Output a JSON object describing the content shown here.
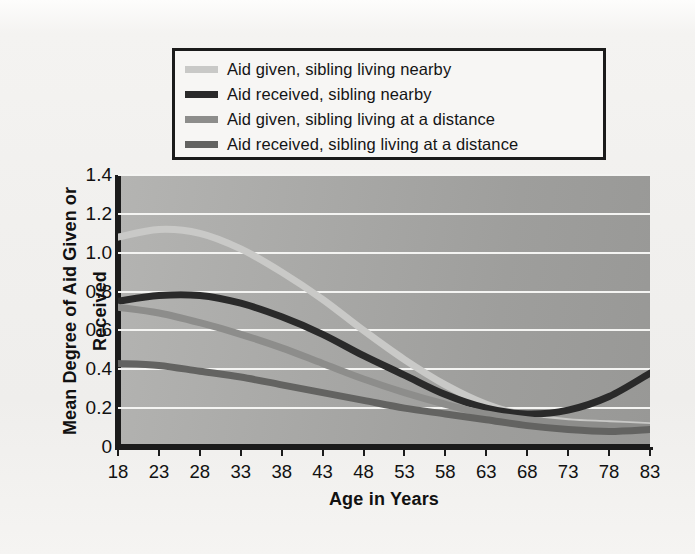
{
  "chart_data": {
    "type": "line",
    "title": "",
    "xlabel": "Age in Years",
    "ylabel": "Mean Degree of Aid Given or Received",
    "xlim": [
      18,
      83
    ],
    "ylim": [
      0,
      1.4
    ],
    "xticks": [
      18,
      23,
      28,
      33,
      38,
      43,
      48,
      53,
      58,
      63,
      68,
      73,
      78,
      83
    ],
    "yticks": [
      "0",
      "0.2",
      "0.4",
      "0.6",
      "0.8",
      "1.0",
      "1.2",
      "1.4"
    ],
    "grid": true,
    "legend_position": "above-plot",
    "x": [
      18,
      23,
      28,
      33,
      38,
      43,
      48,
      53,
      58,
      63,
      68,
      73,
      78,
      83
    ],
    "series": [
      {
        "name": "Aid given, sibling living nearby",
        "color": "#c9c9c7",
        "values": [
          1.08,
          1.12,
          1.1,
          1.02,
          0.9,
          0.76,
          0.6,
          0.45,
          0.32,
          0.22,
          0.16,
          0.13,
          0.12,
          0.11
        ]
      },
      {
        "name": "Aid received, sibling nearby",
        "color": "#2a2a2a",
        "values": [
          0.75,
          0.78,
          0.78,
          0.74,
          0.67,
          0.58,
          0.47,
          0.37,
          0.27,
          0.2,
          0.17,
          0.19,
          0.26,
          0.38
        ]
      },
      {
        "name": "Aid given, sibling living at a distance",
        "color": "#8d8d8b",
        "values": [
          0.72,
          0.69,
          0.64,
          0.58,
          0.51,
          0.43,
          0.35,
          0.28,
          0.22,
          0.17,
          0.14,
          0.12,
          0.11,
          0.1
        ]
      },
      {
        "name": "Aid received, sibling living at a distance",
        "color": "#636361",
        "values": [
          0.43,
          0.42,
          0.39,
          0.36,
          0.32,
          0.28,
          0.24,
          0.2,
          0.17,
          0.14,
          0.11,
          0.09,
          0.08,
          0.09
        ]
      }
    ]
  },
  "legend": {
    "items": [
      {
        "label": "Aid given, sibling living nearby",
        "color": "#c9c9c7"
      },
      {
        "label": "Aid received, sibling nearby",
        "color": "#2a2a2a"
      },
      {
        "label": "Aid given, sibling living at a distance",
        "color": "#8d8d8b"
      },
      {
        "label": "Aid received, sibling living at a distance",
        "color": "#636361"
      }
    ]
  },
  "axes": {
    "x_title": "Age in Years",
    "y_title": "Mean Degree of Aid Given or Received"
  }
}
